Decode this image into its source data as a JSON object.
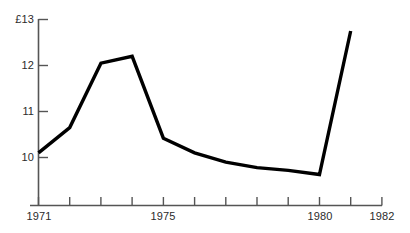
{
  "chart_data": {
    "type": "line",
    "title": "",
    "subtitle": "",
    "xlabel": "",
    "ylabel": "£13",
    "currency_symbol": "£",
    "grid": false,
    "legend": null,
    "x": [
      1971,
      1972,
      1973,
      1974,
      1975,
      1976,
      1977,
      1978,
      1979,
      1980,
      1981
    ],
    "values": [
      10.1,
      10.65,
      12.05,
      12.2,
      10.42,
      10.1,
      9.9,
      9.78,
      9.72,
      9.63,
      12.75
    ],
    "series": [
      {
        "name": "value",
        "values": [
          10.1,
          10.65,
          12.05,
          12.2,
          10.42,
          10.1,
          9.9,
          9.78,
          9.72,
          9.63,
          12.75
        ]
      }
    ],
    "xlim": [
      1971,
      1982
    ],
    "ylim": [
      9.2,
      13.0
    ],
    "yticks": [
      10,
      11,
      12,
      13
    ],
    "ytick_labels": [
      "10",
      "11",
      "12",
      "£13"
    ],
    "xticks": [
      1971,
      1972,
      1973,
      1974,
      1975,
      1976,
      1977,
      1978,
      1979,
      1980,
      1981,
      1982
    ],
    "xtick_labels_shown": [
      "1971",
      "1975",
      "1980",
      "1982"
    ],
    "line_color": "#000000",
    "line_width": 3,
    "axis_color": "#555555"
  },
  "axes": {
    "y_ticks": [
      {
        "label": "£13",
        "value": 13
      },
      {
        "label": "12",
        "value": 12
      },
      {
        "label": "11",
        "value": 11
      },
      {
        "label": "10",
        "value": 10
      }
    ],
    "x_ticks": [
      {
        "label": "1971",
        "value": 1971
      },
      {
        "label": "1975",
        "value": 1975
      },
      {
        "label": "1980",
        "value": 1980
      },
      {
        "label": "1982",
        "value": 1982
      }
    ]
  }
}
